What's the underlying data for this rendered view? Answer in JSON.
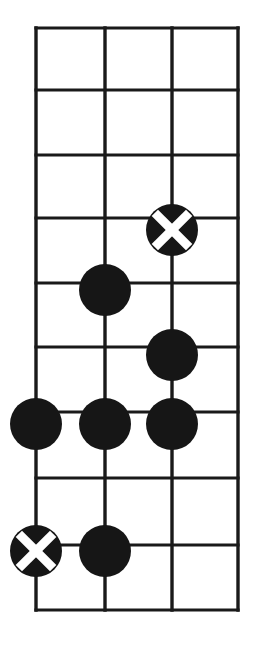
{
  "figure": {
    "name": "go-board-diagram",
    "kind": "go-board",
    "background_color": "#ffffff",
    "line_color": "#1a1a1a",
    "stone_black_color": "#161616",
    "stone_mark_color": "#ffffff"
  },
  "board": {
    "columns": 4,
    "rows": 10,
    "column_x": [
      36,
      105,
      172,
      238
    ],
    "row_y": [
      28,
      90,
      155,
      218,
      283,
      347,
      412,
      478,
      545,
      610
    ],
    "cell_width": 67,
    "cell_height": 64.7,
    "stone_diameter": 52
  },
  "stones": [
    {
      "id": "stone-1",
      "color": "black",
      "mark": "x",
      "col": 3,
      "row": 4,
      "cx": 172,
      "cy": 230,
      "label": "marked-black-stone-upper"
    },
    {
      "id": "stone-2",
      "color": "black",
      "mark": "none",
      "col": 2,
      "row": 5,
      "cx": 105,
      "cy": 290,
      "label": "black-stone"
    },
    {
      "id": "stone-3",
      "color": "black",
      "mark": "none",
      "col": 3,
      "row": 6,
      "cx": 172,
      "cy": 355,
      "label": "black-stone"
    },
    {
      "id": "stone-4",
      "color": "black",
      "mark": "none",
      "col": 1,
      "row": 7,
      "cx": 36,
      "cy": 424,
      "label": "black-stone"
    },
    {
      "id": "stone-5",
      "color": "black",
      "mark": "none",
      "col": 2,
      "row": 7,
      "cx": 105,
      "cy": 424,
      "label": "black-stone"
    },
    {
      "id": "stone-6",
      "color": "black",
      "mark": "none",
      "col": 3,
      "row": 7,
      "cx": 172,
      "cy": 424,
      "label": "black-stone"
    },
    {
      "id": "stone-7",
      "color": "black",
      "mark": "x",
      "col": 1,
      "row": 9,
      "cx": 36,
      "cy": 551,
      "label": "marked-black-stone-lower"
    },
    {
      "id": "stone-8",
      "color": "black",
      "mark": "none",
      "col": 2,
      "row": 9,
      "cx": 105,
      "cy": 551,
      "label": "black-stone"
    }
  ]
}
